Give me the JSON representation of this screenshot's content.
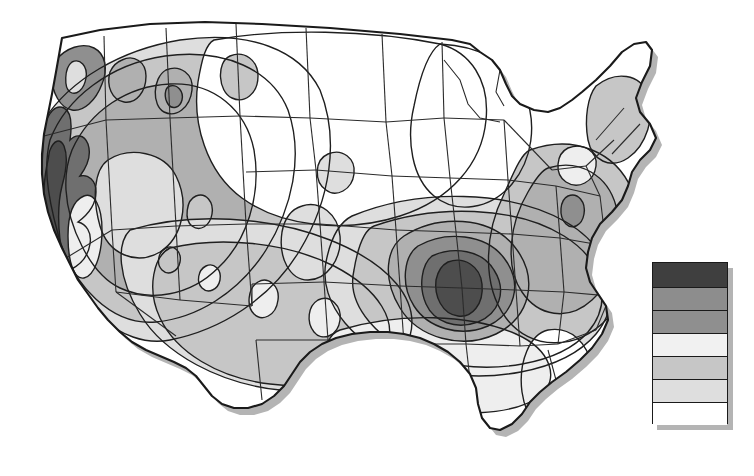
{
  "figure": {
    "kind": "choropleth-contour-map",
    "background_color": "#ffffff",
    "outline_color": "#1a1a1a",
    "shadow_color": "#b4b4b4",
    "state_border_color": "#2b2b2b",
    "contour_line_color": "#1f1f1f"
  },
  "map": {
    "region_name": "Contiguous United States",
    "shadow_offset_x": 6,
    "shadow_offset_y": 7,
    "features": [
      {
        "name": "pacific-coast-maximum",
        "shade": "dark",
        "location": "California coast"
      },
      {
        "name": "central-bullseye-maximum",
        "shade": "darkest",
        "location": "Missouri / Arkansas"
      },
      {
        "name": "northern-plains-minimum",
        "shade": "white",
        "location": "Dakotas / Nebraska / Minnesota"
      },
      {
        "name": "florida-minimum",
        "shade": "white",
        "location": "Florida peninsula"
      },
      {
        "name": "great-lakes-minimum",
        "shade": "white",
        "location": "Great Lakes"
      }
    ]
  },
  "legend": {
    "name": "grayscale-value-legend",
    "x": 652,
    "y": 262,
    "width": 76,
    "height": 162,
    "band_count": 7,
    "order": "highest-to-lowest",
    "bands": [
      {
        "index": 1,
        "color": "#3f3f3f",
        "rank": "highest",
        "height": 25
      },
      {
        "index": 2,
        "color": "#8d8d8d",
        "rank": "high",
        "height": 23
      },
      {
        "index": 3,
        "color": "#8f8f8f",
        "rank": "mid-high",
        "height": 23
      },
      {
        "index": 4,
        "color": "#f1f1f1",
        "rank": "mid",
        "height": 23
      },
      {
        "index": 5,
        "color": "#c6c6c6",
        "rank": "mid-low",
        "height": 23
      },
      {
        "index": 6,
        "color": "#dedede",
        "rank": "low",
        "height": 23
      },
      {
        "index": 7,
        "color": "#ffffff",
        "rank": "lowest",
        "height": 22
      }
    ]
  },
  "palette": {
    "level_0_white": "#ffffff",
    "level_1_lightest": "#eeeeee",
    "level_2_light": "#dedede",
    "level_3_mid_light": "#c6c6c6",
    "level_4_mid": "#b0b0b0",
    "level_5_mid_dark": "#8f8f8f",
    "level_6_dark": "#6f6f6f",
    "level_7_darkest": "#3f3f3f"
  },
  "chart_data": {
    "type": "heatmap",
    "xlabel": "",
    "ylabel": "",
    "legend_position": "right",
    "grid": false,
    "categories": [
      "highest",
      "high",
      "mid-high",
      "mid",
      "mid-low",
      "low",
      "lowest"
    ],
    "values": [
      7,
      6,
      5,
      4,
      3,
      2,
      1
    ],
    "series": [
      {
        "name": "regional value bands",
        "values": [
          7,
          6,
          5,
          4,
          3,
          2,
          1
        ],
        "colors": [
          "#3f3f3f",
          "#8d8d8d",
          "#8f8f8f",
          "#f1f1f1",
          "#c6c6c6",
          "#dedede",
          "#ffffff"
        ]
      }
    ],
    "annotations": [
      {
        "label": "central bullseye maximum",
        "x": 462,
        "y": 278,
        "level": 7
      },
      {
        "label": "pacific coast high",
        "x": 60,
        "y": 215,
        "level": 6
      },
      {
        "label": "northern plains low",
        "x": 330,
        "y": 120,
        "level": 1
      },
      {
        "label": "florida low",
        "x": 600,
        "y": 400,
        "level": 1
      }
    ]
  }
}
